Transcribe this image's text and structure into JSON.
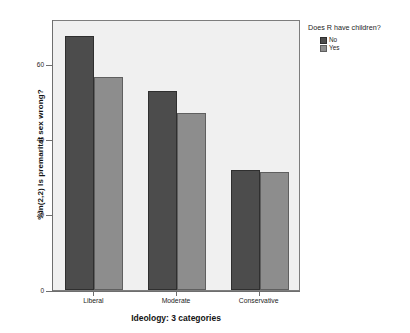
{
  "chart_data": {
    "type": "bar",
    "title": "",
    "subtitle": "",
    "xlabel": "Ideology: 3 categories",
    "ylabel": "%in(2,2) Is premarital sex wrong?",
    "categories": [
      "Liberal",
      "Moderate",
      "Conservative"
    ],
    "series": [
      {
        "name": "No",
        "color": "#4c4c4c",
        "values": [
          67.5,
          52.8,
          32.0
        ]
      },
      {
        "name": "Yes",
        "color": "#8d8d8d",
        "values": [
          56.5,
          47.0,
          31.3
        ]
      }
    ],
    "legend_title": "Does R have children?",
    "legend_position": "right",
    "ylim": [
      0,
      72
    ],
    "yticks": [
      0,
      20,
      40,
      60
    ],
    "ytick_labels": [
      "0",
      "20",
      "40",
      "60"
    ],
    "grid": false,
    "panel_background": "#f0f0f0",
    "frame_color": "#7d7d7d"
  },
  "axes": {
    "y_title": "%in(2,2) Is premarital sex wrong?",
    "x_title": "Ideology: 3 categories"
  },
  "legend": {
    "title": "Does R have children?",
    "entries": [
      {
        "label": "No"
      },
      {
        "label": "Yes"
      }
    ]
  }
}
